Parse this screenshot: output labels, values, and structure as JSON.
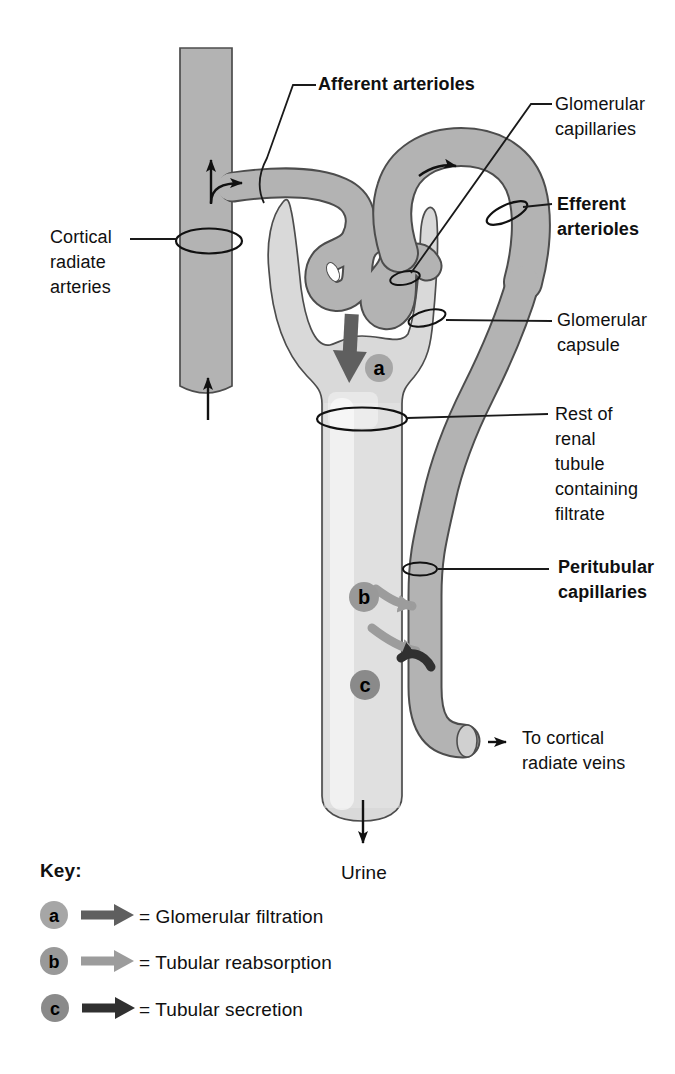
{
  "labels": {
    "afferent_arterioles": "Afferent arterioles",
    "glomerular_capillaries": "Glomerular\ncapillaries",
    "efferent_arterioles": "Efferent\narterioles",
    "cortical_radiate_arteries": "Cortical\nradiate\narteries",
    "glomerular_capsule": "Glomerular\ncapsule",
    "rest_of_renal_tubule": "Rest of\nrenal\ntubule\ncontaining\nfiltrate",
    "peritubular_capillaries": "Peritubular\ncapillaries",
    "to_cortical_radiate_veins": "To cortical\nradiate veins",
    "urine": "Urine"
  },
  "markers": {
    "a": "a",
    "b": "b",
    "c": "c"
  },
  "key": {
    "title": "Key:",
    "items": [
      {
        "marker": "a",
        "label": "= Glomerular filtration"
      },
      {
        "marker": "b",
        "label": "= Tubular reabsorption"
      },
      {
        "marker": "c",
        "label": "= Tubular secretion"
      }
    ]
  },
  "colors": {
    "vessel": "#b3b3b3",
    "capsule": "#d9d9d9",
    "outline": "#4d4d4d",
    "line": "#1a1a1a",
    "filtration_arrow": "#5f5f5f",
    "reabsorption_arrow": "#9c9c9c",
    "secretion_arrow": "#303030",
    "circle_a": "#a6a6a6",
    "circle_b": "#999999",
    "circle_c": "#8a8a8a"
  }
}
